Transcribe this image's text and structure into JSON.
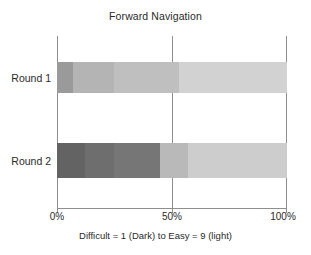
{
  "chart_data": {
    "type": "bar",
    "orientation": "horizontal",
    "stacked": true,
    "normalized_percent": true,
    "title": "Forward Navigation",
    "xlabel": "Difficult = 1 (Dark) to Easy = 9 (light)",
    "ylabel": "",
    "categories": [
      "Round 1",
      "Round 2"
    ],
    "xlim": [
      0,
      100
    ],
    "xticks": [
      0,
      50,
      100
    ],
    "xtick_labels": [
      "0%",
      "50%",
      "100%"
    ],
    "grid": false,
    "legend": "none",
    "scale_note": "Grayscale encodes difficulty rating: 1 = darkest (difficult) through 9 = lightest (easy)",
    "series": [
      {
        "name": "Round 1",
        "segments": [
          {
            "label": "1",
            "value": 7,
            "color": "#9a9a9a"
          },
          {
            "label": "3",
            "value": 18,
            "color": "#b4b4b4"
          },
          {
            "label": "5",
            "value": 28,
            "color": "#bfbfbf"
          },
          {
            "label": "7",
            "value": 47,
            "color": "#d2d2d2"
          }
        ]
      },
      {
        "name": "Round 2",
        "segments": [
          {
            "label": "1",
            "value": 12,
            "color": "#636363"
          },
          {
            "label": "2",
            "value": 13,
            "color": "#6e6e6e"
          },
          {
            "label": "3",
            "value": 20,
            "color": "#767676"
          },
          {
            "label": "5",
            "value": 12,
            "color": "#b9b9b9"
          },
          {
            "label": "7",
            "value": 43,
            "color": "#cdcdcd"
          }
        ]
      }
    ]
  },
  "axis": {
    "line_color": "#8e8e8e"
  }
}
